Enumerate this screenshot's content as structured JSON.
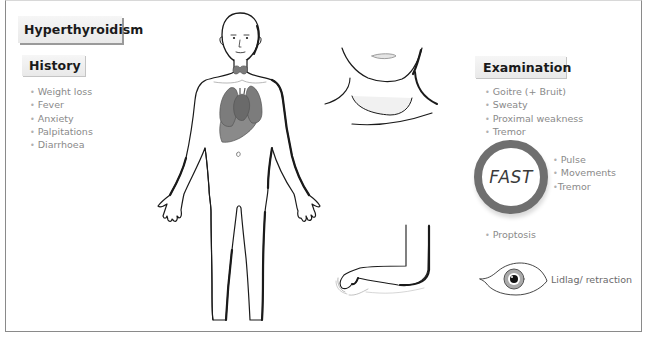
{
  "title": "Hyperthyroidism",
  "history": {
    "heading": "History",
    "items": [
      "Weight loss",
      "Fever",
      "Anxiety",
      "Palpitations",
      "Diarrhoea"
    ]
  },
  "examination": {
    "heading": "Examination",
    "items": [
      "Goitre (+ Bruit)",
      "Sweaty",
      "Proximal weakness",
      "Tremor"
    ],
    "fast": {
      "label": "FAST",
      "items": [
        "Pulse",
        "Movements",
        "Tremor"
      ]
    },
    "proptosis": "Proptosis",
    "eye_caption": "Lidlag/ retraction"
  },
  "illustrations": {
    "body": "full-body-figure",
    "neck": "neck-goitre-closeup",
    "arm": "outstretched-arm-tremor",
    "eye": "eye-lid-retraction"
  },
  "colors": {
    "frame_border": "#8a8a8a",
    "label_bg": "#eeeeee",
    "bullet_text": "#8a8a8a",
    "fast_ring": "#6f6f6f",
    "organs": "#7a7a7a"
  }
}
